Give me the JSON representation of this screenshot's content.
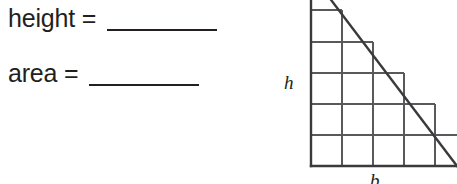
{
  "worksheet": {
    "prompts": [
      {
        "label": "height =",
        "answer": "",
        "blank_name": "height-blank"
      },
      {
        "label": "area =",
        "answer": "",
        "blank_name": "area-blank"
      }
    ]
  },
  "figure": {
    "type": "right-triangle-on-grid",
    "height_label": "h",
    "base_label": "b",
    "grid": {
      "cell_size_px": 31,
      "columns": 5,
      "rows": 5,
      "origin_x": 41,
      "origin_y": 166
    },
    "triangle": {
      "right_angle_corner": "bottom-left",
      "vertical_leg_label": "h",
      "horizontal_leg_label": "b",
      "apex_clipped_at_top": true,
      "hypotenuse_from": "top-left-above-frame",
      "hypotenuse_to": "bottom-right"
    },
    "colors": {
      "ink": "#231f20",
      "grid_line": "#58595b",
      "background": "#ffffff"
    }
  }
}
